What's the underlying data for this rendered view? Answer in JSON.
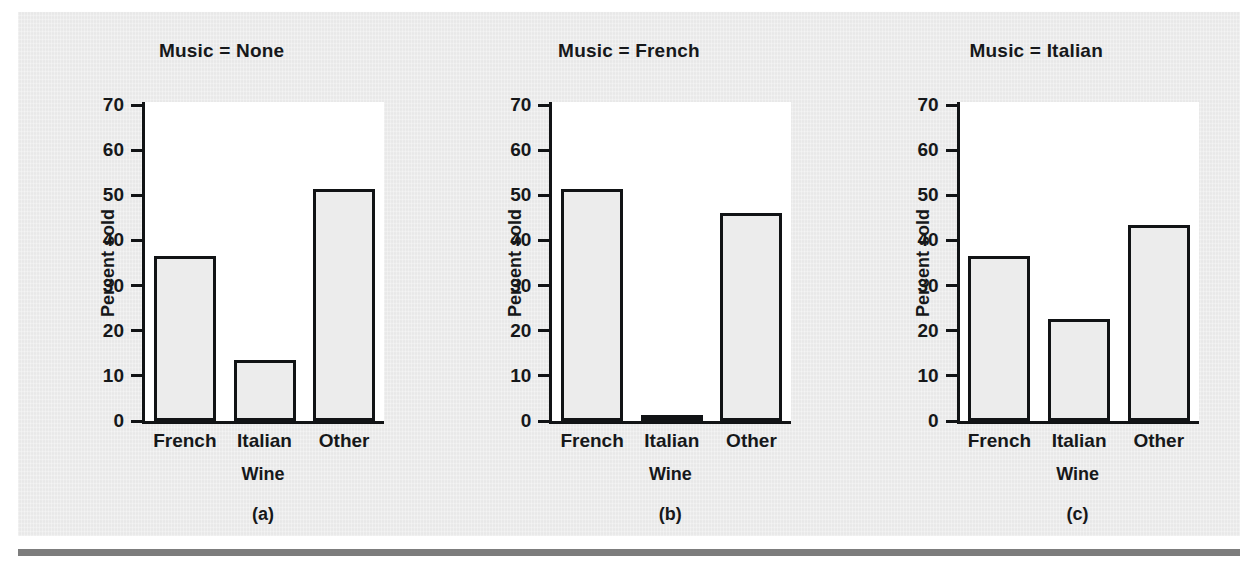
{
  "figure": {
    "background_color": "#ebebeb",
    "page_color": "#ffffff",
    "rule_color": "#7d7d7d",
    "ink_color": "#16181a",
    "bar_fill_color": "#ececec",
    "bar_edge_color": "#111315"
  },
  "chart_data": {
    "type": "bar",
    "title": "",
    "xlabel": "Wine",
    "ylabel": "Percent sold",
    "categories": [
      "French",
      "Italian",
      "Other"
    ],
    "ylim": [
      0,
      70
    ],
    "yticks": [
      0,
      10,
      20,
      30,
      40,
      50,
      60,
      70
    ],
    "ytick_labels": [
      "0",
      "10",
      "20",
      "30",
      "40",
      "50",
      "60",
      "70"
    ],
    "grid": false,
    "legend": null,
    "panels": [
      {
        "id": "a",
        "caption": "(a)",
        "title": "Music = None",
        "xlabel": "Wine",
        "ylabel": "Percent sold",
        "categories": [
          "French",
          "Italian",
          "Other"
        ],
        "values": [
          36.5,
          13.5,
          51.5
        ]
      },
      {
        "id": "b",
        "caption": "(b)",
        "title": "Music = French",
        "xlabel": "Wine",
        "ylabel": "Percent sold",
        "categories": [
          "French",
          "Italian",
          "Other"
        ],
        "values": [
          51.5,
          1.0,
          46.0
        ]
      },
      {
        "id": "c",
        "caption": "(c)",
        "title": "Music = Italian",
        "xlabel": "Wine",
        "ylabel": "Percent sold",
        "categories": [
          "French",
          "Italian",
          "Other"
        ],
        "values": [
          36.5,
          22.5,
          43.5
        ]
      }
    ]
  }
}
